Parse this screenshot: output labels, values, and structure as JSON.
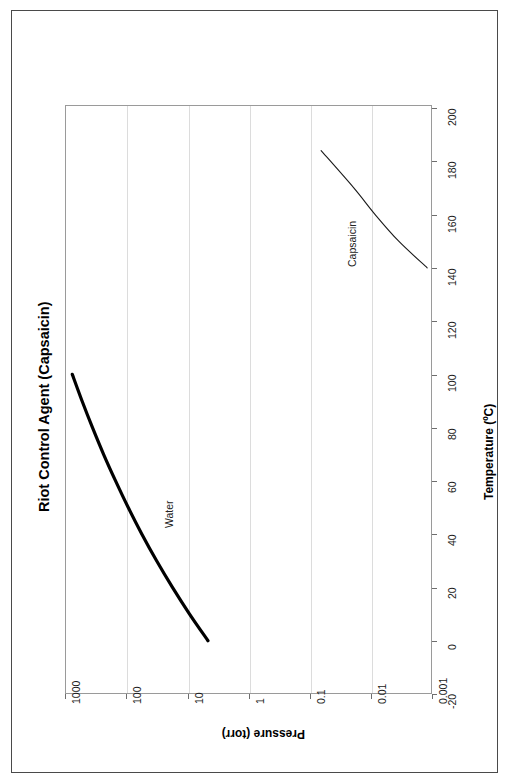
{
  "page": {
    "background": "#ffffff",
    "frame_color": "#4a4a4a"
  },
  "chart_data": {
    "type": "line",
    "title": "Riot Control Agent (Capsaicin)",
    "orientation": "rotated-90-ccw",
    "xlabel": "Pressure (torr)",
    "ylabel": "Temperature (ºC)",
    "x_scale": "log",
    "y_scale": "linear",
    "xlim": [
      1000,
      0.001
    ],
    "ylim": [
      -20,
      200
    ],
    "x_ticks": [
      "1000",
      "100",
      "10",
      "1",
      "0.1",
      "0.01",
      "0.001"
    ],
    "x_tick_values": [
      1000,
      100,
      10,
      1,
      0.1,
      0.01,
      0.001
    ],
    "y_ticks": [
      "-20",
      "0",
      "20",
      "40",
      "60",
      "80",
      "100",
      "120",
      "140",
      "160",
      "180",
      "200"
    ],
    "y_tick_values": [
      -20,
      0,
      20,
      40,
      60,
      80,
      100,
      120,
      140,
      160,
      180,
      200
    ],
    "grid": "vertical-decades-only",
    "legend": "inline-labels",
    "series": [
      {
        "name": "Water",
        "color": "#000000",
        "line_width": 3,
        "points": [
          {
            "temperature_C": 100,
            "pressure_torr": 760
          },
          {
            "temperature_C": 90,
            "pressure_torr": 526
          },
          {
            "temperature_C": 80,
            "pressure_torr": 355
          },
          {
            "temperature_C": 70,
            "pressure_torr": 234
          },
          {
            "temperature_C": 60,
            "pressure_torr": 149
          },
          {
            "temperature_C": 50,
            "pressure_torr": 92.5
          },
          {
            "temperature_C": 40,
            "pressure_torr": 55.3
          },
          {
            "temperature_C": 30,
            "pressure_torr": 31.8
          },
          {
            "temperature_C": 20,
            "pressure_torr": 17.5
          },
          {
            "temperature_C": 10,
            "pressure_torr": 9.2
          },
          {
            "temperature_C": 0,
            "pressure_torr": 4.6
          }
        ]
      },
      {
        "name": "Capsaicin",
        "color": "#1a1a1a",
        "line_width": 1,
        "points": [
          {
            "temperature_C": 184,
            "pressure_torr": 0.065
          },
          {
            "temperature_C": 170,
            "pressure_torr": 0.019
          },
          {
            "temperature_C": 160,
            "pressure_torr": 0.0085
          },
          {
            "temperature_C": 150,
            "pressure_torr": 0.0035
          },
          {
            "temperature_C": 140,
            "pressure_torr": 0.0012
          }
        ]
      }
    ],
    "annotations": [
      {
        "text": "Water",
        "near_series": "Water"
      },
      {
        "text": "Capsaicin",
        "near_series": "Capsaicin"
      }
    ]
  }
}
